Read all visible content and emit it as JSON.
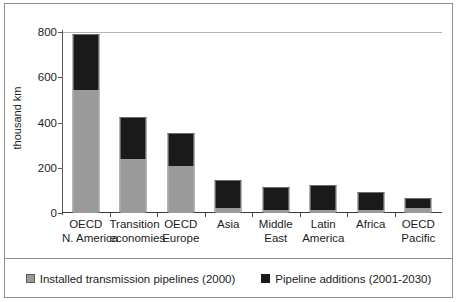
{
  "chart_data": {
    "type": "bar",
    "stacked": true,
    "title": "",
    "xlabel": "",
    "ylabel": "thousand km",
    "ylim": [
      0,
      800
    ],
    "yticks": [
      0,
      200,
      400,
      600,
      800
    ],
    "grid": false,
    "legend_position": "bottom",
    "categories": [
      "OECD N. America",
      "Transition economies",
      "OECD Europe",
      "Asia",
      "Middle East",
      "Latin America",
      "Africa",
      "OECD Pacific"
    ],
    "category_lines": [
      [
        "OECD",
        "N. America"
      ],
      [
        "Transition",
        "economies"
      ],
      [
        "OECD",
        "Europe"
      ],
      [
        "Asia",
        ""
      ],
      [
        "Middle",
        "East"
      ],
      [
        "Latin",
        "America"
      ],
      [
        "Africa",
        ""
      ],
      [
        "OECD",
        "Pacific"
      ]
    ],
    "series": [
      {
        "name": "Installed transmission pipelines (2000)",
        "color": "#9a9a9a",
        "values": [
          545,
          240,
          210,
          20,
          15,
          15,
          12,
          20
        ]
      },
      {
        "name": "Pipeline additions (2001-2030)",
        "color": "#1a1a1a",
        "values": [
          240,
          180,
          140,
          120,
          95,
          105,
          78,
          40
        ]
      }
    ],
    "totals": [
      785,
      420,
      350,
      140,
      110,
      120,
      90,
      60
    ]
  },
  "legend": {
    "items": [
      {
        "label": "Installed transmission pipelines (2000)",
        "swatch": "gray"
      },
      {
        "label": "Pipeline additions (2001-2030)",
        "swatch": "black"
      }
    ]
  },
  "axis": {
    "y_title": "thousand km",
    "y_tick_labels": [
      "800",
      "600",
      "400",
      "200",
      "0"
    ]
  }
}
